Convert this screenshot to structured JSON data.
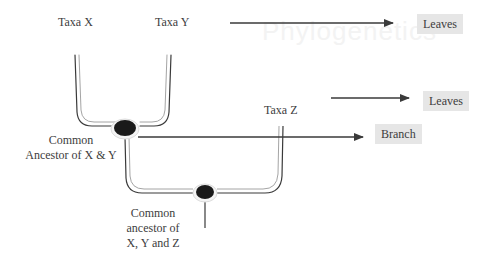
{
  "background_text": "Phylogenetics",
  "taxa": {
    "x": "Taxa X",
    "y": "Taxa Y",
    "z": "Taxa Z"
  },
  "nodes": {
    "xy_line1": "Common",
    "xy_line2": "Ancestor of X & Y",
    "xyz_line1": "Common",
    "xyz_line2": "ancestor of",
    "xyz_line3": "X, Y and Z"
  },
  "callouts": {
    "leaves_top": "Leaves",
    "leaves_mid": "Leaves",
    "branch": "Branch"
  },
  "colors": {
    "line": "#3a3a3a",
    "node": "#1a1a1a",
    "tag_bg": "#e6e6e6"
  }
}
